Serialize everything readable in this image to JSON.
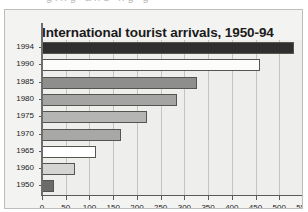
{
  "clipped_header_text": "ging  and  ng   g",
  "chart_data": {
    "type": "bar",
    "orientation": "horizontal",
    "title": "International tourist arrivals, 1950-94",
    "xlabel": "million",
    "ylabel": "",
    "categories": [
      "1994",
      "1990",
      "1985",
      "1980",
      "1975",
      "1970",
      "1965",
      "1960",
      "1950"
    ],
    "values": [
      531,
      459,
      327,
      285,
      222,
      166,
      113,
      69,
      25
    ],
    "bar_colors": [
      "#2f2f2f",
      "#fcfcfa",
      "#8e8e8c",
      "#a4a4a2",
      "#b5b5b3",
      "#a8a8a6",
      "#ffffff",
      "#d4d4d2",
      "#6b6b69"
    ],
    "xlim": [
      0,
      550
    ],
    "xticks": [
      0,
      50,
      100,
      150,
      200,
      250,
      300,
      350,
      400,
      450,
      500,
      550
    ],
    "xtick_labels": [
      "0",
      "50",
      "100",
      "150",
      "200",
      "250",
      "300",
      "350",
      "400",
      "450",
      "500",
      "550"
    ],
    "grid": true,
    "grid_axis": "x",
    "legend": false,
    "plot_background": "#eeeeec",
    "figure_background": "#f3f3f1",
    "axis_color": "#5a5a5a"
  }
}
